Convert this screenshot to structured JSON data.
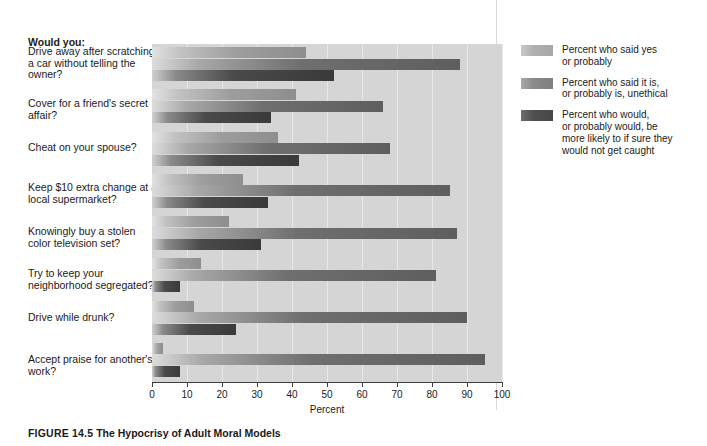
{
  "figure": {
    "number_label": "FIGURE 14.5",
    "title": "The Hypocrisy of Adult Moral Models"
  },
  "prompt_heading": "Would you:",
  "legend": {
    "items": [
      {
        "label": "Percent who said yes\nor probably",
        "color": "#b0b0b0"
      },
      {
        "label": "Percent who said it is,\nor probably is, unethical",
        "color": "#8a8a8a"
      },
      {
        "label": "Percent who would,\nor probably would, be\nmore likely to if sure they\nwould not get caught",
        "color": "#4f4f4f"
      }
    ]
  },
  "chart_data": {
    "type": "bar",
    "orientation": "horizontal",
    "title": "The Hypocrisy of Adult Moral Models",
    "xlabel": "Percent",
    "ylabel": "",
    "xlim": [
      0,
      100
    ],
    "xticks": [
      0,
      10,
      20,
      30,
      40,
      50,
      60,
      70,
      80,
      90,
      100
    ],
    "grid": true,
    "legend_position": "right",
    "categories": [
      "Drive away after scratching a car without telling the owner?",
      "Cover for a friend's secret affair?",
      "Cheat on your spouse?",
      "Keep $10 extra change at a local supermarket?",
      "Knowingly buy a stolen color television set?",
      "Try to keep your neighborhood segregated?",
      "Drive while drunk?",
      "Accept praise for another's work?"
    ],
    "series": [
      {
        "name": "Percent who said yes or probably",
        "color": "#b0b0b0",
        "values": [
          44,
          41,
          36,
          26,
          22,
          14,
          12,
          3
        ]
      },
      {
        "name": "Percent who said it is, or probably is, unethical",
        "color": "#8a8a8a",
        "values": [
          88,
          66,
          68,
          85,
          87,
          81,
          90,
          95
        ]
      },
      {
        "name": "Percent who would, or probably would, be more likely to if sure they would not get caught",
        "color": "#4f4f4f",
        "values": [
          52,
          34,
          42,
          33,
          31,
          8,
          24,
          8
        ]
      }
    ]
  }
}
